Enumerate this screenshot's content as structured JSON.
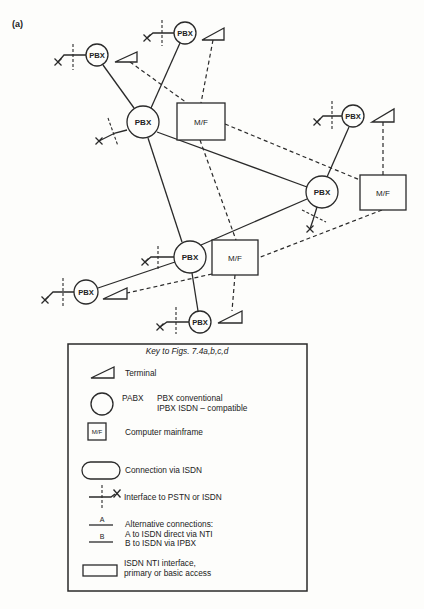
{
  "figure": {
    "panel_label": "(a)"
  },
  "diagram": {
    "pbx_nodes": [
      {
        "position": "top-left",
        "label": "PBX"
      },
      {
        "position": "top",
        "label": "PBX"
      },
      {
        "position": "main",
        "label": "PBX"
      },
      {
        "position": "top-right",
        "label": "PBX"
      },
      {
        "position": "right",
        "label": "PBX"
      },
      {
        "position": "center-bottom",
        "label": "PBX"
      },
      {
        "position": "bottom-left",
        "label": "PBX"
      },
      {
        "position": "bottom",
        "label": "PBX"
      }
    ],
    "mainframes": [
      {
        "position": "main",
        "label": "M/F"
      },
      {
        "position": "right",
        "label": "M/F"
      },
      {
        "position": "bottom",
        "label": "M/F"
      }
    ],
    "connections": [
      {
        "from": "pbx-top-left",
        "to": "pbx-main",
        "type": "solid"
      },
      {
        "from": "pbx-top",
        "to": "pbx-main",
        "type": "solid"
      },
      {
        "from": "pbx-main",
        "to": "pbx-center-bottom",
        "type": "solid"
      },
      {
        "from": "pbx-main",
        "to": "pbx-right",
        "type": "solid"
      },
      {
        "from": "pbx-center-bottom",
        "to": "pbx-right",
        "type": "solid"
      },
      {
        "from": "pbx-center-bottom",
        "to": "pbx-bottom-left",
        "type": "solid"
      },
      {
        "from": "pbx-center-bottom",
        "to": "pbx-bottom",
        "type": "solid"
      },
      {
        "from": "pbx-right",
        "to": "pbx-top-right",
        "type": "solid"
      },
      {
        "from": "terminal-top-left",
        "to": "mf-main",
        "type": "dashed"
      },
      {
        "from": "terminal-top",
        "to": "mf-main",
        "type": "dashed"
      },
      {
        "from": "mf-main",
        "to": "mf-right",
        "type": "dashed"
      },
      {
        "from": "mf-main",
        "to": "mf-bottom",
        "type": "dashed"
      },
      {
        "from": "terminal-top-right",
        "to": "mf-right",
        "type": "dashed"
      },
      {
        "from": "mf-right",
        "to": "mf-bottom",
        "type": "dashed"
      },
      {
        "from": "mf-bottom",
        "to": "terminal-bottom-left",
        "type": "dashed"
      },
      {
        "from": "mf-bottom",
        "to": "terminal-bottom",
        "type": "dashed"
      }
    ]
  },
  "legend": {
    "title": "Key to Figs. 7.4a,b,c,d",
    "terminal": {
      "label": "Terminal"
    },
    "pabx": {
      "abbr": "PABX",
      "line1": "PBX conventional",
      "line2": "IPBX ISDN – compatible"
    },
    "mainframe": {
      "box_label": "M/F",
      "label": "Computer mainframe"
    },
    "isdn_connection": {
      "label": "Connection via ISDN"
    },
    "interface": {
      "label": "Interface to PSTN or ISDN"
    },
    "alternative": {
      "a_marker": "A",
      "b_marker": "B",
      "line1": "Alternative connections:",
      "line2": "A to ISDN direct via NTI",
      "line3": "B to ISDN via IPBX"
    },
    "nti": {
      "line1": "ISDN NTI interface,",
      "line2": "primary or basic access"
    }
  }
}
